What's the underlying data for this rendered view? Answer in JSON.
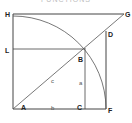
{
  "title": "FUNCTIONS",
  "colors": {
    "line": "#444444",
    "arc": "#555555",
    "label": "#222222",
    "background": "#ffffff"
  },
  "points": {
    "H": {
      "label": "H",
      "x": 13,
      "y": 14
    },
    "G": {
      "label": "G",
      "x": 124,
      "y": 14
    },
    "D": {
      "label": "D",
      "x": 106,
      "y": 31
    },
    "L": {
      "label": "L",
      "x": 13,
      "y": 49
    },
    "B": {
      "label": "B",
      "x": 85,
      "y": 48
    },
    "A": {
      "label": "A",
      "x": 13,
      "y": 109
    },
    "C": {
      "label": "C",
      "x": 85,
      "y": 109
    },
    "F": {
      "label": "F",
      "x": 106,
      "y": 109
    }
  },
  "segment_labels": {
    "a": "a",
    "b": "b",
    "c": "c"
  }
}
